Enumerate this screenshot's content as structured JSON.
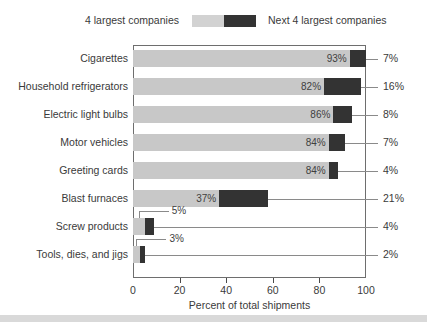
{
  "legend": {
    "series_a_label": "4 largest companies",
    "series_b_label": "Next 4 largest companies",
    "swatch_a_color": "#c8c8c8",
    "swatch_b_color": "#333333"
  },
  "axis": {
    "x_title": "Percent of total shipments",
    "x_ticks": [
      "0",
      "20",
      "40",
      "60",
      "80",
      "100"
    ]
  },
  "rows": [
    {
      "category": "Cigarettes",
      "a": "93%",
      "b": "7%"
    },
    {
      "category": "Household refrigerators",
      "a": "82%",
      "b": "16%"
    },
    {
      "category": "Electric light bulbs",
      "a": "86%",
      "b": "8%"
    },
    {
      "category": "Motor vehicles",
      "a": "84%",
      "b": "7%"
    },
    {
      "category": "Greeting cards",
      "a": "84%",
      "b": "4%"
    },
    {
      "category": "Blast furnaces",
      "a": "37%",
      "b": "21%"
    },
    {
      "category": "Screw products",
      "a": "5%",
      "b": "4%"
    },
    {
      "category": "Tools, dies, and jigs",
      "a": "3%",
      "b": "2%"
    }
  ],
  "chart_data": {
    "type": "bar",
    "orientation": "horizontal",
    "stacked": true,
    "title": "",
    "xlabel": "Percent of total shipments",
    "ylabel": "",
    "xlim": [
      0,
      100
    ],
    "xticks": [
      0,
      20,
      40,
      60,
      80,
      100
    ],
    "grid": false,
    "legend_position": "top",
    "categories": [
      "Cigarettes",
      "Household refrigerators",
      "Electric light bulbs",
      "Motor vehicles",
      "Greeting cards",
      "Blast furnaces",
      "Screw products",
      "Tools, dies, and jigs"
    ],
    "series": [
      {
        "name": "4 largest companies",
        "color": "#c8c8c8",
        "values": [
          93,
          82,
          86,
          84,
          84,
          37,
          5,
          3
        ],
        "labels": [
          "93%",
          "82%",
          "86%",
          "84%",
          "84%",
          "37%",
          "5%",
          "3%"
        ]
      },
      {
        "name": "Next 4 largest companies",
        "color": "#333333",
        "values": [
          7,
          16,
          8,
          7,
          4,
          21,
          4,
          2
        ],
        "labels": [
          "7%",
          "16%",
          "8%",
          "7%",
          "4%",
          "21%",
          "4%",
          "2%"
        ]
      }
    ]
  }
}
